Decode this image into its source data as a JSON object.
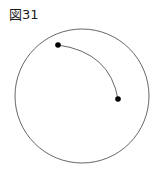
{
  "figure": {
    "caption": "図31",
    "background_color": "#ffffff",
    "stroke_color": "#555555",
    "dot_color": "#000000",
    "canvas": {
      "width": 157,
      "height": 181
    },
    "circle": {
      "name": "outer-circle",
      "center_x": 82,
      "center_y": 96,
      "radius": 67,
      "stroke_width": 0.9,
      "fill": "none"
    },
    "arc": {
      "name": "connecting-arc",
      "start_x": 58,
      "start_y": 45,
      "end_x": 118,
      "end_y": 99,
      "control_x": 110,
      "control_y": 52,
      "stroke_width": 0.9,
      "bulge_direction": "upper-right"
    },
    "points": [
      {
        "label": "start-point",
        "x": 58,
        "y": 45,
        "radius": 2.8
      },
      {
        "label": "end-point",
        "x": 118,
        "y": 99,
        "radius": 2.8
      }
    ]
  }
}
